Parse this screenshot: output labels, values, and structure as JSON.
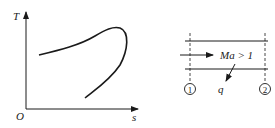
{
  "left_diagram": {
    "type": "T-s diagram",
    "y_axis_label": "T",
    "x_axis_label": "s",
    "origin_label": "O",
    "curve": "single curve rising from left, peaking at upper right, turning back down-left"
  },
  "right_diagram": {
    "flow_label": "Ma > 1",
    "heat_label": "q",
    "section_1_label": "1",
    "section_2_label": "2"
  },
  "colors": {
    "stroke": "#1a1a1a",
    "background": "#ffffff"
  }
}
